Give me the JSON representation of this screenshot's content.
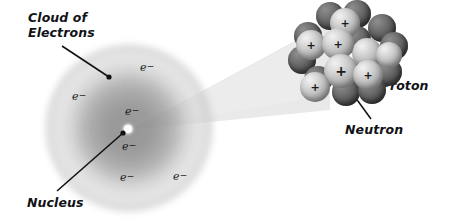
{
  "figure": {
    "type": "atomic-structure-diagram",
    "background_color": "#ffffff",
    "width": 452,
    "height": 224
  },
  "labels": {
    "cloud_of_electrons": "Cloud of\nElectrons",
    "nucleus": "Nucleus",
    "proton": "Proton",
    "neutron": "Neutron"
  },
  "electron_symbol": {
    "base": "e",
    "charge": "−"
  },
  "electrons": [
    {
      "id": "electron-1",
      "x": 140,
      "y": 68,
      "label": "e"
    },
    {
      "id": "electron-2",
      "x": 72,
      "y": 97,
      "label": "e"
    },
    {
      "id": "electron-3",
      "x": 125,
      "y": 112,
      "label": "e"
    },
    {
      "id": "electron-4",
      "x": 122,
      "y": 147,
      "label": "e"
    },
    {
      "id": "electron-5",
      "x": 120,
      "y": 178,
      "label": "e"
    },
    {
      "id": "electron-6",
      "x": 173,
      "y": 177,
      "label": "e"
    }
  ],
  "callouts": [
    {
      "id": "callout-cloud",
      "text_x": 28,
      "text_y": 12,
      "line_from_x": 62,
      "line_from_y": 46,
      "line_to_x": 109,
      "line_to_y": 77,
      "dot_x": 109,
      "dot_y": 77
    },
    {
      "id": "callout-nucleus",
      "text_x": 27,
      "text_y": 197,
      "line_from_x": 57,
      "line_from_y": 191,
      "line_to_x": 122,
      "line_to_y": 134,
      "dot_x": 122,
      "dot_y": 134
    },
    {
      "id": "callout-proton",
      "text_x": 381,
      "text_y": 79,
      "line_from_x": 378,
      "line_from_y": 79,
      "line_to_x": 356,
      "line_to_y": 66,
      "dot_x": 356,
      "dot_y": 66
    },
    {
      "id": "callout-neutron",
      "text_x": 345,
      "text_y": 123,
      "line_from_x": 371,
      "line_from_y": 120,
      "line_to_x": 355,
      "line_to_y": 98,
      "dot_x": 355,
      "dot_y": 98
    }
  ],
  "electron_cloud": {
    "center_x": 129,
    "center_y": 128,
    "radius": 84,
    "nucleus_dot_x": 128,
    "nucleus_dot_y": 129,
    "fill_color": "#9a9a9a"
  },
  "connector_wedge": {
    "apex_x": 130,
    "apex_y": 130,
    "top_x": 330,
    "top_y": 22,
    "bottom_x": 330,
    "bottom_y": 110,
    "fill_color": "#e8e8e8"
  },
  "nucleus_cluster": {
    "proton_color": "#c9c9c9",
    "neutron_color": "#555555",
    "plus_sign": "+",
    "particles": [
      {
        "id": "n-back-1",
        "kind": "neutron",
        "x": 28,
        "y": 2,
        "d": 28,
        "z": 1
      },
      {
        "id": "n-back-2",
        "kind": "neutron",
        "x": 55,
        "y": 0,
        "d": 28,
        "z": 1
      },
      {
        "id": "n-back-3",
        "kind": "neutron",
        "x": 80,
        "y": 14,
        "d": 28,
        "z": 1
      },
      {
        "id": "n-back-4",
        "kind": "neutron",
        "x": 6,
        "y": 22,
        "d": 28,
        "z": 1
      },
      {
        "id": "n-back-5",
        "kind": "neutron",
        "x": 92,
        "y": 32,
        "d": 28,
        "z": 1
      },
      {
        "id": "n-back-6",
        "kind": "neutron",
        "x": 0,
        "y": 46,
        "d": 28,
        "z": 1
      },
      {
        "id": "n-back-7",
        "kind": "neutron",
        "x": 55,
        "y": 26,
        "d": 28,
        "z": 2
      },
      {
        "id": "n-back-8",
        "kind": "neutron",
        "x": 86,
        "y": 58,
        "d": 28,
        "z": 2
      },
      {
        "id": "n-back-9",
        "kind": "neutron",
        "x": 16,
        "y": 66,
        "d": 28,
        "z": 2
      },
      {
        "id": "n-front-1",
        "kind": "neutron",
        "x": 44,
        "y": 78,
        "d": 28,
        "z": 5
      },
      {
        "id": "n-front-2",
        "kind": "neutron",
        "x": 70,
        "y": 76,
        "d": 28,
        "z": 5
      },
      {
        "id": "p-1",
        "kind": "proton",
        "x": 42,
        "y": 8,
        "d": 30,
        "z": 3,
        "plus": true,
        "plus_size": 11
      },
      {
        "id": "p-2",
        "kind": "proton",
        "x": 8,
        "y": 30,
        "d": 30,
        "z": 3,
        "plus": true,
        "plus_size": 11
      },
      {
        "id": "p-3",
        "kind": "proton",
        "x": 34,
        "y": 28,
        "d": 32,
        "z": 4,
        "plus": true,
        "plus_size": 11
      },
      {
        "id": "p-4",
        "kind": "proton",
        "x": 64,
        "y": 38,
        "d": 30,
        "z": 3,
        "plus": false,
        "plus_size": 11
      },
      {
        "id": "p-5",
        "kind": "proton",
        "x": 36,
        "y": 54,
        "d": 34,
        "z": 6,
        "plus": true,
        "plus_size": 14
      },
      {
        "id": "p-6",
        "kind": "proton",
        "x": 65,
        "y": 60,
        "d": 30,
        "z": 6,
        "plus": true,
        "plus_size": 11
      },
      {
        "id": "p-7",
        "kind": "proton",
        "x": 12,
        "y": 72,
        "d": 30,
        "z": 6,
        "plus": true,
        "plus_size": 11
      },
      {
        "id": "p-8",
        "kind": "proton",
        "x": 88,
        "y": 42,
        "d": 26,
        "z": 4,
        "plus": false,
        "plus_size": 10
      }
    ]
  }
}
